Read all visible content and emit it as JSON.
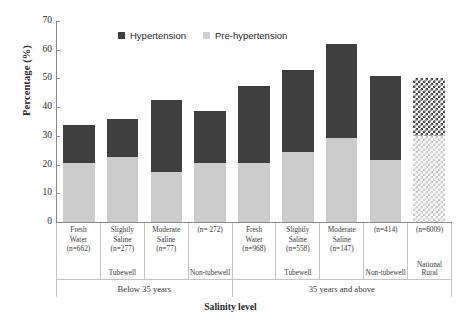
{
  "chart_data": {
    "type": "bar",
    "subtype": "stacked",
    "title": "",
    "xlabel": "Salinity level",
    "ylabel": "Percentage (%)",
    "ylim": [
      0,
      70
    ],
    "yticks": [
      0,
      10,
      20,
      30,
      40,
      50,
      60,
      70
    ],
    "grid": false,
    "legend_position": "top-center",
    "categories": [
      "Fresh Water (n=662)",
      "Slightly Saline (n=277)",
      "Moderate Saline (n=77)",
      "(n= 272)",
      "Fresh Water (n=968)",
      "Slightly Saline (n=558)",
      "Moderate Saline (n=147)",
      "(n=414)",
      "(n=6009)"
    ],
    "series": [
      {
        "name": "Pre-hypertension",
        "color": "#cccccc",
        "values": [
          20.5,
          22.8,
          17.3,
          20.5,
          20.6,
          24.4,
          29.3,
          21.6,
          30.0
        ]
      },
      {
        "name": "Hypertension",
        "color": "#3f3f3f",
        "values": [
          13.3,
          13.1,
          25.2,
          18.0,
          26.9,
          28.4,
          32.7,
          29.4,
          20.0
        ]
      }
    ],
    "totals": [
      33.8,
      35.9,
      42.5,
      38.5,
      47.5,
      52.8,
      62.0,
      51.0,
      50.0
    ]
  },
  "legend": {
    "items": [
      {
        "label": "Hypertension",
        "swatch": "hypertension-swatch"
      },
      {
        "label": "Pre-hypertension",
        "swatch": "pre-hypertension-swatch"
      }
    ]
  },
  "axes": {
    "y_title": "Percentage (%)",
    "x_title": "Salinity level",
    "y_ticks": [
      "70",
      "60",
      "50",
      "40",
      "30",
      "20",
      "10",
      "0"
    ]
  },
  "categories": [
    {
      "name": "Fresh Water",
      "n": "(n=662)",
      "sub": ""
    },
    {
      "name": "Slightly Saline",
      "n": "(n=277)",
      "sub": "Tubewell"
    },
    {
      "name": "Moderate Saline",
      "n": "(n=77)",
      "sub": ""
    },
    {
      "name": "",
      "n": "(n= 272)",
      "sub": "Non-tubewell"
    },
    {
      "name": "Fresh Water",
      "n": "(n=968)",
      "sub": ""
    },
    {
      "name": "Slightly Saline",
      "n": "(n=558)",
      "sub": "Tubewell"
    },
    {
      "name": "Moderate Saline",
      "n": "(n=147)",
      "sub": ""
    },
    {
      "name": "",
      "n": "(n=414)",
      "sub": "Non-tubewell"
    },
    {
      "name": "",
      "n": "(n=6009)",
      "sub": "National Rural"
    }
  ],
  "groups": [
    {
      "label": "Below 35 years",
      "span": 4
    },
    {
      "label": "35 years and above",
      "span": 5
    }
  ]
}
